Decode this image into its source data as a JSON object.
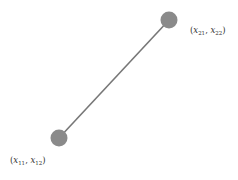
{
  "diagram": {
    "points": [
      {
        "id": "p1",
        "label_var": "x",
        "sub_a": "11",
        "sub_b": "12",
        "color": "#8a8a8a"
      },
      {
        "id": "p2",
        "label_var": "x",
        "sub_a": "21",
        "sub_b": "22",
        "color": "#8a8a8a"
      }
    ],
    "line_color": "#777777",
    "label_color": "#333333"
  }
}
